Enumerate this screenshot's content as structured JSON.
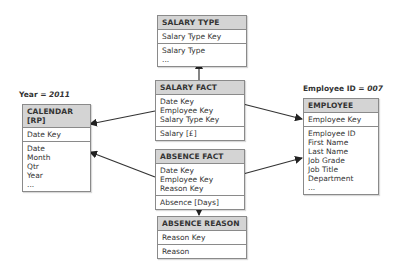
{
  "filters": {
    "year": {
      "label": "Year = ",
      "value": "2011"
    },
    "employee": {
      "label": "Employee ID = ",
      "value": "007"
    }
  },
  "entities": {
    "salary_type": {
      "title": "SALARY TYPE",
      "keys": [
        "Salary Type Key"
      ],
      "attributes": [
        "Salary Type",
        "..."
      ]
    },
    "salary_fact": {
      "title": "SALARY FACT",
      "keys": [
        "Date Key",
        "Employee Key",
        "Salary Type Key"
      ],
      "measures": [
        "Salary [£]"
      ]
    },
    "absence_fact": {
      "title": "ABSENCE FACT",
      "keys": [
        "Date Key",
        "Employee Key",
        "Reason Key"
      ],
      "measures": [
        "Absence [Days]"
      ]
    },
    "absence_reason": {
      "title": "ABSENCE REASON",
      "keys": [
        "Reason Key"
      ],
      "attributes": [
        "Reason"
      ]
    },
    "calendar": {
      "title": "CALENDAR [RP]",
      "keys": [
        "Date Key"
      ],
      "attributes": [
        "Date",
        "Month",
        "Qtr",
        "Year",
        "..."
      ]
    },
    "employee": {
      "title": "EMPLOYEE",
      "keys": [
        "Employee Key"
      ],
      "attributes": [
        "Employee ID",
        "First Name",
        "Last Name",
        "Job Grade",
        "Job Title",
        "Department",
        "..."
      ]
    }
  },
  "colors": {
    "header_bg": "#d4d4d4",
    "border": "#8a8a8a",
    "line": "#333333"
  }
}
